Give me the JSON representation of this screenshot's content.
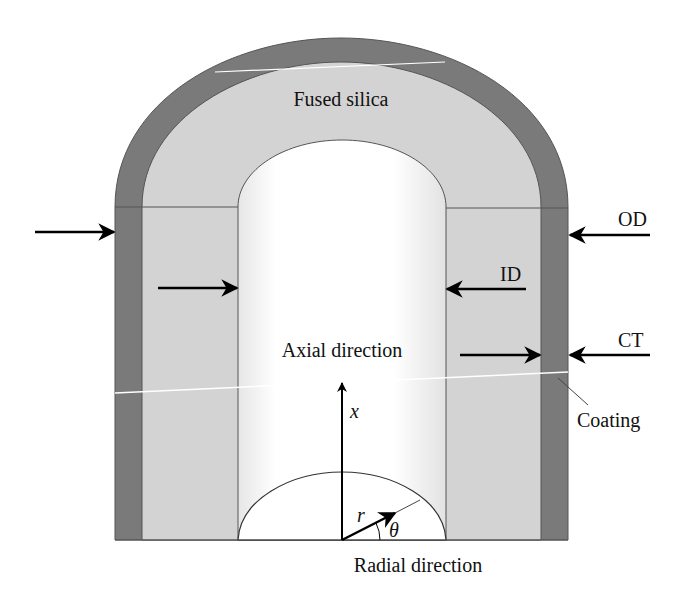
{
  "diagram": {
    "labels": {
      "material": "Fused silica",
      "axial": "Axial direction",
      "radial": "Radial direction",
      "od": "OD",
      "id": "ID",
      "ct": "CT",
      "coating": "Coating",
      "x_axis": "x",
      "r_vector": "r",
      "theta": "θ"
    },
    "colors": {
      "coating": "#7a7a7a",
      "silica": "#d3d3d3",
      "bore": "#ffffff",
      "outline": "#444444",
      "arrow": "#000000"
    }
  }
}
